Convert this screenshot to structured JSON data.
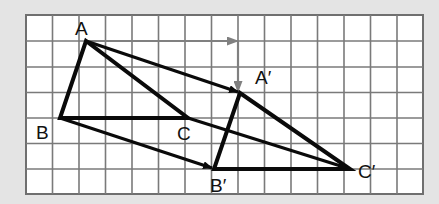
{
  "figure": {
    "type": "translation-diagram",
    "grid": {
      "columns": 15,
      "rows": 7
    },
    "colors": {
      "background": "#e4e4e4",
      "grid_fill": "#ffffff",
      "grid_line": "#7a7a7a",
      "shape_line": "#0a0a0a",
      "vector_arrow": "#808080"
    },
    "points": {
      "A": {
        "label": "A",
        "x": 86,
        "y": 41
      },
      "B": {
        "label": "B",
        "x": 60,
        "y": 118
      },
      "C": {
        "label": "C",
        "x": 188,
        "y": 118
      },
      "A_prime": {
        "label": "A′",
        "x": 240,
        "y": 93
      },
      "B_prime": {
        "label": "B′",
        "x": 214,
        "y": 169
      },
      "C_prime": {
        "label": "C′",
        "x": 350,
        "y": 169
      }
    },
    "translation_vector": {
      "right": 6,
      "down": 2
    }
  }
}
